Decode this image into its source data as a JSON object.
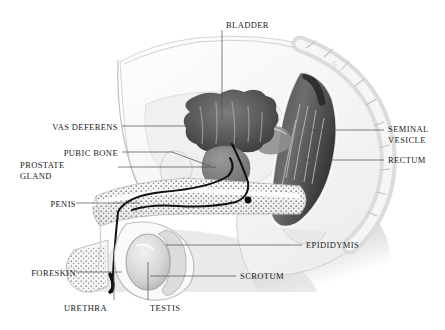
{
  "figure": {
    "background": "#ffffff",
    "ink": "#1a1a1a",
    "leader_color": "#4a4a4a"
  },
  "labels": [
    {
      "id": "bladder",
      "text": "BLADDER",
      "x": 226,
      "y": 20,
      "align": "l",
      "leader": [
        [
          222,
          30
        ],
        [
          222,
          120
        ]
      ]
    },
    {
      "id": "vas-deferens",
      "text": "VAS DEFERENS",
      "x": 118,
      "y": 122,
      "align": "l",
      "leader": [
        [
          122,
          126
        ],
        [
          196,
          126
        ]
      ]
    },
    {
      "id": "pubic-bone",
      "text": "PUBIC BONE",
      "x": 118,
      "y": 148,
      "align": "l",
      "leader": [
        [
          122,
          152
        ],
        [
          172,
          152
        ],
        [
          210,
          166
        ]
      ]
    },
    {
      "id": "prostate-gland",
      "line1": "PROSTATE",
      "line2": "GLAND",
      "text": "PROSTATE\nGLAND",
      "x": 70,
      "y": 163,
      "align": "l",
      "leader": [
        [
          118,
          167
        ],
        [
          216,
          167
        ]
      ]
    },
    {
      "id": "penis",
      "text": "PENIS",
      "x": 70,
      "y": 199,
      "align": "l",
      "leader": [
        [
          76,
          203
        ],
        [
          140,
          203
        ]
      ]
    },
    {
      "id": "foreskin",
      "text": "FORESKIN",
      "x": 70,
      "y": 268,
      "align": "l",
      "leader": [
        [
          76,
          272
        ],
        [
          122,
          272
        ]
      ]
    },
    {
      "id": "urethra",
      "text": "URETHRA",
      "x": 66,
      "y": 303,
      "align": "l",
      "leader": [
        [
          114,
          300
        ],
        [
          114,
          272
        ]
      ]
    },
    {
      "id": "testis",
      "text": "TESTIS",
      "x": 146,
      "y": 303,
      "align": "r",
      "leader": [
        [
          148,
          300
        ],
        [
          148,
          262
        ]
      ]
    },
    {
      "id": "scrotum",
      "text": "SCROTUM",
      "x": 238,
      "y": 272,
      "align": "r",
      "leader": [
        [
          236,
          276
        ],
        [
          150,
          276
        ]
      ]
    },
    {
      "id": "epididymis",
      "text": "EPIDIDYMIS",
      "x": 306,
      "y": 241,
      "align": "r",
      "leader": [
        [
          302,
          245
        ],
        [
          166,
          245
        ]
      ]
    },
    {
      "id": "rectum",
      "text": "RECTUM",
      "x": 388,
      "y": 156,
      "align": "r",
      "leader": [
        [
          384,
          160
        ],
        [
          304,
          160
        ]
      ]
    },
    {
      "id": "seminal-vesicle",
      "line1": "SEMINAL",
      "line2": "VESICLE",
      "text": "SEMINAL\nVESICLE",
      "x": 388,
      "y": 126,
      "align": "r",
      "leader": [
        [
          384,
          130
        ],
        [
          310,
          130
        ]
      ]
    }
  ],
  "structures": [
    {
      "id": "bladder-organ",
      "name": "bladder"
    },
    {
      "id": "prostate-organ",
      "name": "prostate gland"
    },
    {
      "id": "rectum-organ",
      "name": "rectum"
    },
    {
      "id": "testis-organ",
      "name": "testis"
    },
    {
      "id": "epididymis-organ",
      "name": "epididymis"
    },
    {
      "id": "scrotum-organ",
      "name": "scrotum"
    },
    {
      "id": "penis-shaft",
      "name": "penis"
    },
    {
      "id": "urethra-duct",
      "name": "urethra"
    },
    {
      "id": "vas-deferens-duct",
      "name": "vas deferens"
    },
    {
      "id": "pubic-bone-organ",
      "name": "pubic bone"
    },
    {
      "id": "sacrum-vertebrae",
      "name": "sacrum and vertebrae"
    },
    {
      "id": "body-outline",
      "name": "body outline"
    }
  ]
}
